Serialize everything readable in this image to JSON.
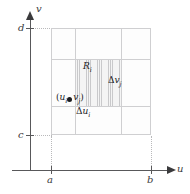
{
  "figure": {
    "name": "uv-plane-partition-diagram",
    "axes": {
      "horizontal": {
        "name": "u",
        "icon": "arrow-right-icon"
      },
      "vertical": {
        "name": "v",
        "icon": "arrow-up-icon"
      }
    },
    "ticks": {
      "u_min": "a",
      "u_max": "b",
      "v_min": "c",
      "v_max": "d"
    },
    "labels": {
      "subrectangle": {
        "base": "R",
        "sub": "i"
      },
      "sample_point": {
        "open": "(",
        "u_base": "u",
        "u_sub": "i",
        "comma": ", ",
        "v_base": "v",
        "v_sub": "j",
        "close": ")"
      },
      "delta_u": {
        "delta": "Δ",
        "base": "u",
        "sub": "i"
      },
      "delta_v": {
        "delta": "Δ",
        "base": "v",
        "sub": "j"
      }
    },
    "grid": {
      "columns": 3,
      "rows": 3,
      "highlighted_cell": {
        "column": 2,
        "row": 2
      },
      "hatch_style": "vertical-lines"
    },
    "colors": {
      "axis": "#58585a",
      "grid_line": "#cfcfd1",
      "hatch": "#c9c9cb",
      "point": "#1c1c1e",
      "text": "#1c1c1e",
      "guide": "#b9b9bb",
      "background": "#ffffff"
    }
  },
  "chart_data": {
    "type": "diagram",
    "title": "",
    "xlabel": "u",
    "ylabel": "v",
    "xlim": [
      "a",
      "b"
    ],
    "ylim": [
      "c",
      "d"
    ],
    "grid": true
  }
}
